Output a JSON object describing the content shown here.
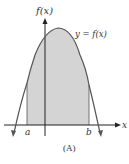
{
  "figure": {
    "y_axis_label": "f(x)",
    "x_axis_label": "x",
    "curve_label": "y = f(x)",
    "lower_bound_label": "a",
    "upper_bound_label": "b",
    "caption": "(A)"
  },
  "colors": {
    "shade": "#d4d4d4",
    "curve": "#555555",
    "axis": "#222222",
    "text": "#333333"
  }
}
